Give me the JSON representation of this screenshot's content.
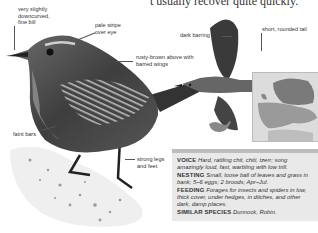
{
  "page": {
    "top_text": "t usually recover quite quickly."
  },
  "labels": {
    "bill": "very slightly downcurved, fine bill",
    "eye_stripe": "pale stripe over eye",
    "upperparts": "rusty-brown above with barred wings",
    "flanks": "faint bars",
    "legs": "strong legs and feet",
    "flight_barring": "dark barring",
    "tail": "short, rounded tail"
  },
  "infobox": {
    "voice_label": "VOICE",
    "voice_text": "Hard, rattling chit, chiti, tzerr; song amazingly loud, fast, warbling with low trill.",
    "nesting_label": "NESTING",
    "nesting_text": "Small, loose ball of leaves and grass in bank; 5–6 eggs; 2 broods; Apr–Jul.",
    "feeding_label": "FEEDING",
    "feeding_text": "Forages for insects and spiders in low, thick cover, under hedges, in ditches, and other dark, damp places.",
    "similar_label": "SIMILAR SPECIES",
    "similar_text": "Dunnock, Robin."
  },
  "icons": {
    "map": "europe-range-map-icon",
    "silhouette": "wren-silhouette-icon"
  }
}
